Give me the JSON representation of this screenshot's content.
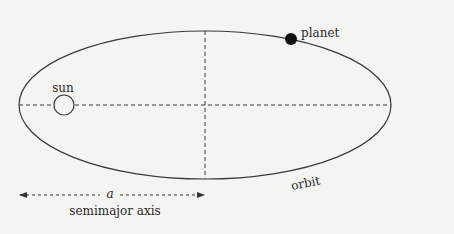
{
  "diagram": {
    "labels": {
      "planet": "planet",
      "sun": "sun",
      "orbit": "orbit",
      "axis_symbol": "a",
      "axis_caption": "semimajor axis"
    },
    "colors": {
      "background": "#f4f4f2",
      "stroke": "#3a3a3a",
      "planet_fill": "#111111"
    },
    "geometry": {
      "ellipse": {
        "cx": 205,
        "cy": 105,
        "rx": 186,
        "ry": 74
      },
      "sun": {
        "cx": 64,
        "cy": 105,
        "r": 10
      },
      "planet": {
        "cx": 291,
        "cy": 39,
        "r": 6
      }
    }
  }
}
